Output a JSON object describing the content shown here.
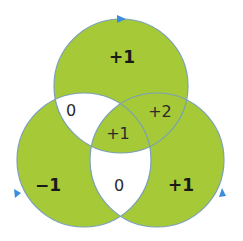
{
  "colors": {
    "fill": "#a6c937",
    "stroke": "#7aa0b8",
    "background": "#ffffff",
    "arrow": "#3a8fd8",
    "text": "#1a1a1a"
  },
  "circles": [
    {
      "name": "top",
      "cx": 121,
      "cy": 86,
      "r": 67
    },
    {
      "name": "left",
      "cx": 84,
      "cy": 160,
      "r": 67
    },
    {
      "name": "right",
      "cx": 157,
      "cy": 160,
      "r": 67
    }
  ],
  "regions": {
    "top_only": "+1",
    "left_only": "−1",
    "right_only": "+1",
    "top_left": "0",
    "top_right": "+2",
    "left_right": "0",
    "center": "+1"
  }
}
